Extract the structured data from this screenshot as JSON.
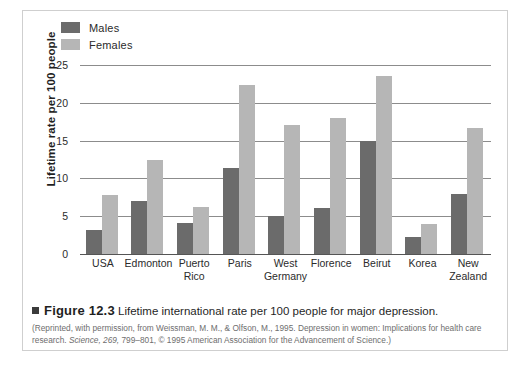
{
  "legend": {
    "entries": [
      {
        "label": "Males",
        "color": "#6b6b6b"
      },
      {
        "label": "Females",
        "color": "#b6b6b6"
      }
    ]
  },
  "axis": {
    "ylabel": "Lifetime rate per 100 people",
    "yticks": [
      "0",
      "5",
      "10",
      "15",
      "20",
      "25"
    ]
  },
  "caption": {
    "figure_number": "Figure 12.3",
    "title": "Lifetime international rate per 100 people for major depression.",
    "source_line1": "(Reprinted, with permission, from Weissman, M. M., & Olfson, M., 1995. Depression in women: Implications for",
    "source_line2_a": "health care research. ",
    "source_line2_italic": "Science, 269,",
    "source_line2_b": " 799–801, © 1995 American Association for the Advancement of Science.)"
  },
  "chart_data": {
    "type": "bar",
    "title": "Lifetime international rate per 100 people for major depression.",
    "xlabel": "",
    "ylabel": "Lifetime rate per 100 people",
    "ylim": [
      0,
      25
    ],
    "yticks": [
      0,
      5,
      10,
      15,
      20,
      25
    ],
    "grid": true,
    "legend_position": "top-left",
    "categories": [
      "USA",
      "Edmonton",
      "Puerto Rico",
      "Paris",
      "West Germany",
      "Florence",
      "Beirut",
      "Korea",
      "New Zealand"
    ],
    "category_lines": [
      [
        "USA"
      ],
      [
        "Edmonton"
      ],
      [
        "Puerto",
        "Rico"
      ],
      [
        "Paris"
      ],
      [
        "West",
        "Germany"
      ],
      [
        "Florence"
      ],
      [
        "Beirut"
      ],
      [
        "Korea"
      ],
      [
        "New",
        "Zealand"
      ]
    ],
    "series": [
      {
        "name": "Males",
        "color": "#6b6b6b",
        "values": [
          3.2,
          7.0,
          4.1,
          11.4,
          5.0,
          6.1,
          15.0,
          2.2,
          8.0
        ]
      },
      {
        "name": "Females",
        "color": "#b6b6b6",
        "values": [
          7.8,
          12.5,
          6.2,
          22.4,
          17.0,
          18.0,
          23.5,
          4.0,
          16.7
        ]
      }
    ]
  }
}
